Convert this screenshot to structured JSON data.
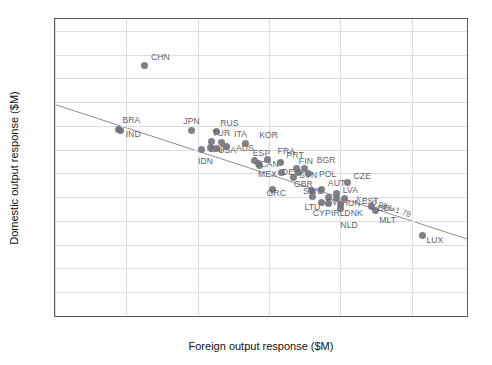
{
  "chart_data": {
    "type": "scatter",
    "title": "",
    "xlabel": "Foreign output response ($M)",
    "ylabel": "Domestic output response ($M)",
    "xlim": [
      0.0,
      1.155
    ],
    "ylim": [
      0.0,
      2.5
    ],
    "xticks": [
      "0.0",
      "0.2",
      "0.4",
      "0.6",
      "0.8",
      "1.0"
    ],
    "xtick_values": [
      0.0,
      0.2,
      0.4,
      0.6,
      0.8,
      1.0
    ],
    "yticks": [
      "0.0",
      "0.2",
      "0.4",
      "0.6",
      "0.8",
      "1.0",
      "1.2",
      "1.4",
      "1.6",
      "1.8",
      "2.0",
      "2.2",
      "2.4"
    ],
    "ytick_values": [
      0.0,
      0.2,
      0.4,
      0.6,
      0.8,
      1.0,
      1.2,
      1.4,
      1.6,
      1.8,
      2.0,
      2.2,
      2.4
    ],
    "grid": true,
    "legend": "none",
    "marker_color": "#6e6e78",
    "line_color": "#8c8c93",
    "annotation": "y = -0.98x+1.78",
    "fit": {
      "slope": -0.98,
      "intercept": 1.78,
      "x_start": 0.0,
      "x_end": 1.155
    },
    "points": [
      {
        "label": "CHN",
        "x": 0.252,
        "y": 2.108,
        "lx": 6,
        "ly": -10
      },
      {
        "label": "BRA",
        "x": 0.178,
        "y": 1.572,
        "lx": 4,
        "ly": -10
      },
      {
        "label": "IND",
        "x": 0.184,
        "y": 1.558,
        "lx": 5,
        "ly": 2
      },
      {
        "label": "JPN",
        "x": 0.382,
        "y": 1.56,
        "lx": -8,
        "ly": -11
      },
      {
        "label": "RUS",
        "x": 0.452,
        "y": 1.552,
        "lx": 4,
        "ly": -10
      },
      {
        "label": "TUR",
        "x": 0.438,
        "y": 1.47,
        "lx": 1,
        "ly": -9
      },
      {
        "label": "ITA",
        "x": 0.468,
        "y": 1.462,
        "lx": 12,
        "ly": -9
      },
      {
        "label": "KOR",
        "x": 0.533,
        "y": 1.45,
        "lx": 14,
        "ly": -10
      },
      {
        "label": "ZAF",
        "x": 0.437,
        "y": 1.418,
        "lx": -2,
        "ly": 0
      },
      {
        "label": "USA",
        "x": 0.452,
        "y": 1.412,
        "lx": 2,
        "ly": 1
      },
      {
        "label": "AUS",
        "x": 0.482,
        "y": 1.428,
        "lx": 9,
        "ly": 1
      },
      {
        "label": "IDN",
        "x": 0.412,
        "y": 1.4,
        "lx": -4,
        "ly": 10
      },
      {
        "label": "ESP",
        "x": 0.56,
        "y": 1.308,
        "lx": -2,
        "ly": -9
      },
      {
        "label": "FRA",
        "x": 0.596,
        "y": 1.316,
        "lx": 10,
        "ly": -10
      },
      {
        "label": "CAN",
        "x": 0.57,
        "y": 1.282,
        "lx": 2,
        "ly": -1
      },
      {
        "label": "MEX",
        "x": 0.572,
        "y": 1.268,
        "lx": -1,
        "ly": 8
      },
      {
        "label": "PRT",
        "x": 0.632,
        "y": 1.288,
        "lx": 6,
        "ly": -9
      },
      {
        "label": "DEU",
        "x": 0.636,
        "y": 1.212,
        "lx": 0,
        "ly": -1
      },
      {
        "label": "FIN",
        "x": 0.678,
        "y": 1.238,
        "lx": 2,
        "ly": -9
      },
      {
        "label": "BGR",
        "x": 0.7,
        "y": 1.24,
        "lx": 12,
        "ly": -10
      },
      {
        "label": "SVN",
        "x": 0.682,
        "y": 1.206,
        "lx": 1,
        "ly": 1
      },
      {
        "label": "POL",
        "x": 0.712,
        "y": 1.198,
        "lx": 10,
        "ly": -1
      },
      {
        "label": "GBR",
        "x": 0.67,
        "y": 1.168,
        "lx": 0,
        "ly": 6
      },
      {
        "label": "CZE",
        "x": 0.82,
        "y": 1.122,
        "lx": 6,
        "ly": -8
      },
      {
        "label": "GRC",
        "x": 0.61,
        "y": 1.062,
        "lx": -6,
        "ly": 2
      },
      {
        "label": "SWE",
        "x": 0.718,
        "y": 1.058,
        "lx": -8,
        "ly": 0
      },
      {
        "label": "AUT",
        "x": 0.748,
        "y": 1.062,
        "lx": 6,
        "ly": -8
      },
      {
        "label": "LTU",
        "x": 0.722,
        "y": 1.008,
        "lx": -8,
        "ly": 10
      },
      {
        "label": "LVA",
        "x": 0.79,
        "y": 1.03,
        "lx": 6,
        "ly": -5
      },
      {
        "label": "SVK",
        "x": 0.768,
        "y": 0.998,
        "lx": -3,
        "ly": 4
      },
      {
        "label": "HUN",
        "x": 0.79,
        "y": 0.992,
        "lx": 5,
        "ly": 4
      },
      {
        "label": "EST",
        "x": 0.812,
        "y": 0.992,
        "lx": 17,
        "ly": 2
      },
      {
        "label": "CYP",
        "x": 0.748,
        "y": 0.952,
        "lx": -9,
        "ly": 9
      },
      {
        "label": "IRL",
        "x": 0.768,
        "y": 0.95,
        "lx": 2,
        "ly": 9
      },
      {
        "label": "DNK",
        "x": 0.8,
        "y": 0.942,
        "lx": 4,
        "ly": 8
      },
      {
        "label": "NLD",
        "x": 0.8,
        "y": 0.902,
        "lx": 0,
        "ly": 15
      },
      {
        "label": "BEL",
        "x": 0.888,
        "y": 0.922,
        "lx": 6,
        "ly": 1
      },
      {
        "label": "MLT",
        "x": 0.898,
        "y": 0.892,
        "lx": 4,
        "ly": 9
      },
      {
        "label": "LUX",
        "x": 1.03,
        "y": 0.676,
        "lx": 4,
        "ly": 3
      }
    ]
  }
}
